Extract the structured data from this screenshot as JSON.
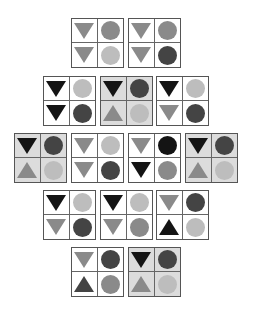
{
  "colors": {
    "black": "#141414",
    "dark": "#444444",
    "mid": "#8a8a8a",
    "light": "#bdbdbd"
  },
  "cards": [
    {
      "x": 71,
      "y": 18,
      "shaded": false,
      "cells": [
        [
          "tri-down",
          "mid"
        ],
        [
          "circle",
          "mid"
        ],
        [
          "tri-down",
          "mid"
        ],
        [
          "circle",
          "light"
        ]
      ]
    },
    {
      "x": 128,
      "y": 18,
      "shaded": false,
      "cells": [
        [
          "tri-down",
          "mid"
        ],
        [
          "circle",
          "mid"
        ],
        [
          "tri-down",
          "mid"
        ],
        [
          "circle",
          "dark"
        ]
      ]
    },
    {
      "x": 43,
      "y": 76,
      "shaded": false,
      "cells": [
        [
          "tri-down",
          "black"
        ],
        [
          "circle",
          "light"
        ],
        [
          "tri-down",
          "black"
        ],
        [
          "circle",
          "dark"
        ]
      ]
    },
    {
      "x": 100,
      "y": 76,
      "shaded": true,
      "cells": [
        [
          "tri-down",
          "black"
        ],
        [
          "circle",
          "dark"
        ],
        [
          "tri-up",
          "mid"
        ],
        [
          "circle",
          "light"
        ]
      ]
    },
    {
      "x": 156,
      "y": 76,
      "shaded": false,
      "cells": [
        [
          "tri-down",
          "black"
        ],
        [
          "circle",
          "light"
        ],
        [
          "tri-down",
          "mid"
        ],
        [
          "circle",
          "dark"
        ]
      ]
    },
    {
      "x": 14,
      "y": 133,
      "shaded": true,
      "cells": [
        [
          "tri-down",
          "black"
        ],
        [
          "circle",
          "dark"
        ],
        [
          "tri-up",
          "mid"
        ],
        [
          "circle",
          "light"
        ]
      ]
    },
    {
      "x": 71,
      "y": 133,
      "shaded": false,
      "cells": [
        [
          "tri-down",
          "mid"
        ],
        [
          "circle",
          "light"
        ],
        [
          "tri-down",
          "mid"
        ],
        [
          "circle",
          "dark"
        ]
      ]
    },
    {
      "x": 128,
      "y": 133,
      "shaded": false,
      "cells": [
        [
          "tri-down",
          "mid"
        ],
        [
          "circle",
          "black"
        ],
        [
          "tri-down",
          "black"
        ],
        [
          "circle",
          "mid"
        ]
      ]
    },
    {
      "x": 185,
      "y": 133,
      "shaded": true,
      "cells": [
        [
          "tri-down",
          "black"
        ],
        [
          "circle",
          "dark"
        ],
        [
          "tri-up",
          "mid"
        ],
        [
          "circle",
          "light"
        ]
      ]
    },
    {
      "x": 43,
      "y": 190,
      "shaded": false,
      "cells": [
        [
          "tri-down",
          "black"
        ],
        [
          "circle",
          "light"
        ],
        [
          "tri-down",
          "mid"
        ],
        [
          "circle",
          "dark"
        ]
      ]
    },
    {
      "x": 100,
      "y": 190,
      "shaded": false,
      "cells": [
        [
          "tri-down",
          "black"
        ],
        [
          "circle",
          "light"
        ],
        [
          "tri-down",
          "mid"
        ],
        [
          "circle",
          "mid"
        ]
      ]
    },
    {
      "x": 156,
      "y": 190,
      "shaded": false,
      "cells": [
        [
          "tri-down",
          "mid"
        ],
        [
          "circle",
          "dark"
        ],
        [
          "tri-up",
          "black"
        ],
        [
          "circle",
          "light"
        ]
      ]
    },
    {
      "x": 71,
      "y": 247,
      "shaded": false,
      "cells": [
        [
          "tri-down",
          "mid"
        ],
        [
          "circle",
          "dark"
        ],
        [
          "tri-up",
          "dark"
        ],
        [
          "circle",
          "mid"
        ]
      ]
    },
    {
      "x": 128,
      "y": 247,
      "shaded": true,
      "cells": [
        [
          "tri-down",
          "black"
        ],
        [
          "circle",
          "dark"
        ],
        [
          "tri-up",
          "mid"
        ],
        [
          "circle",
          "light"
        ]
      ]
    }
  ]
}
